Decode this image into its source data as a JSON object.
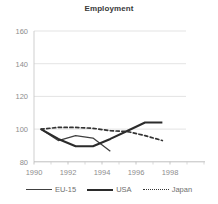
{
  "chart_data": {
    "type": "line",
    "title": "Employment",
    "xlabel": "",
    "ylabel": "",
    "xlim": [
      1989.6,
      1999.4
    ],
    "ylim": [
      80,
      160
    ],
    "xticks": [
      1990,
      1992,
      1994,
      1996,
      1998
    ],
    "yticks": [
      80,
      100,
      120,
      140,
      160
    ],
    "grid": true,
    "legend_position": "bottom",
    "series": [
      {
        "name": "EU-15",
        "style": "solid",
        "color": "#404040",
        "x": [
          1990,
          1991,
          1992,
          1993,
          1994
        ],
        "values": [
          100,
          93,
          96,
          94.5,
          86.5
        ]
      },
      {
        "name": "USA",
        "style": "solid-thick",
        "color": "#2b2b2b",
        "x": [
          1990,
          1991,
          1992,
          1993,
          1994,
          1995,
          1996,
          1997
        ],
        "values": [
          100,
          94,
          89.5,
          89.5,
          94,
          99,
          104,
          104
        ]
      },
      {
        "name": "Japan",
        "style": "dotted",
        "color": "#333333",
        "x": [
          1990,
          1991,
          1992,
          1993,
          1994,
          1995,
          1996,
          1997
        ],
        "values": [
          100,
          101,
          101,
          100.5,
          99,
          98.5,
          96,
          93
        ]
      }
    ]
  },
  "chart": {
    "title": "Employment",
    "ytick_labels": [
      "160",
      "140",
      "120",
      "100",
      "80"
    ],
    "xtick_labels": [
      "1990",
      "1992",
      "1994",
      "1996",
      "1998"
    ]
  },
  "legend": {
    "items": [
      {
        "label": "EU-15",
        "swatch": "solid-line-swatch"
      },
      {
        "label": "USA",
        "swatch": "solid-thick-line-swatch"
      },
      {
        "label": "Japan",
        "swatch": "dotted-line-swatch"
      }
    ]
  }
}
